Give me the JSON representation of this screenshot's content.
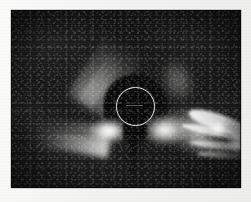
{
  "image": {
    "kind": "coronagraph-photograph",
    "title": "",
    "caption": "",
    "border_color": "#f2f2f0",
    "background_color": "#080808"
  },
  "frame": {
    "label": "coronagraph-field",
    "x": 11,
    "y": 10,
    "width": 230,
    "height": 178
  },
  "occulter": {
    "label": "occulting-disk",
    "center_x": 124,
    "center_y": 97,
    "radius": 32,
    "color": "#060606"
  },
  "limb_circle": {
    "label": "solar-limb-circle",
    "center_x": 124,
    "center_y": 96,
    "radius": 18,
    "stroke_color": "#f8f8f4",
    "stroke_width": 1.3
  },
  "features": [
    {
      "name": "streamer-west",
      "description": "bright triangular streamer fan extending left from the occulter",
      "brightness": "high"
    },
    {
      "name": "streamer-east",
      "description": "bright streamer base at the right edge of the occulter",
      "brightness": "high"
    },
    {
      "name": "cme-loop",
      "description": "large structured coronal mass ejection extending to the lower right",
      "brightness": "very high"
    },
    {
      "name": "ray-northwest",
      "description": "faint diagonal ray bundle in the upper left quadrant",
      "brightness": "low"
    },
    {
      "name": "ray-northeast",
      "description": "faint diffuse ray blob in the upper right quadrant",
      "brightness": "low"
    }
  ]
}
